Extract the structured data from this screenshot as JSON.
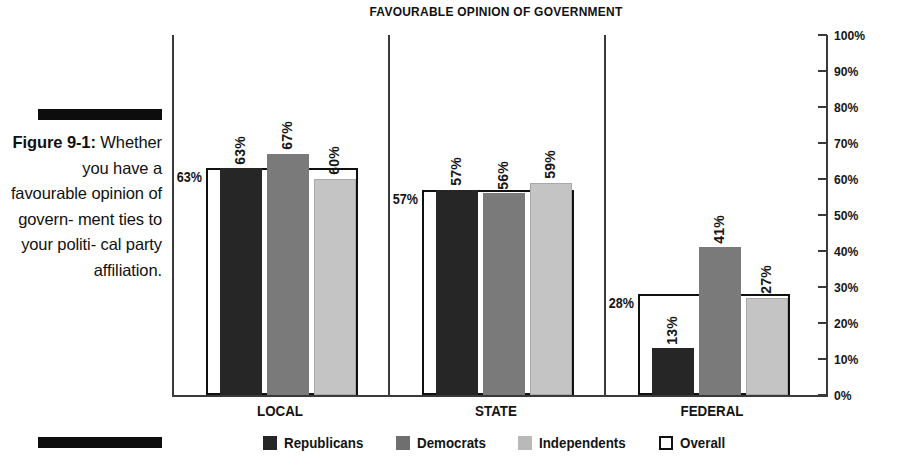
{
  "figure": {
    "number_label": "Figure 9-1:",
    "caption_text": "Whether you have a favourable opinion of govern- ment ties to your politi- cal party affiliation."
  },
  "chart_data": {
    "type": "bar",
    "title": "FAVOURABLE OPINION OF GOVERNMENT",
    "xlabel": "",
    "ylabel": "",
    "ylim": [
      0,
      100
    ],
    "grid": false,
    "legend_position": "bottom",
    "axis_side": "right",
    "value_suffix": "%",
    "categories": [
      "LOCAL",
      "STATE",
      "FEDERAL"
    ],
    "tick_labels": [
      "100%",
      "90%",
      "80%",
      "70%",
      "60%",
      "50%",
      "40%",
      "30%",
      "20%",
      "10%",
      "0%"
    ],
    "tick_values": [
      100,
      90,
      80,
      70,
      60,
      50,
      40,
      30,
      20,
      10,
      0
    ],
    "series": [
      {
        "name": "Republicans",
        "color": "#262626",
        "values": [
          63,
          57,
          13
        ],
        "labels": [
          "63%",
          "57%",
          "13%"
        ]
      },
      {
        "name": "Democrats",
        "color": "#7a7a7a",
        "values": [
          67,
          56,
          41
        ],
        "labels": [
          "67%",
          "56%",
          "41%"
        ]
      },
      {
        "name": "Independents",
        "color": "#c4c4c4",
        "values": [
          60,
          59,
          27
        ],
        "labels": [
          "60%",
          "59%",
          "27%"
        ]
      },
      {
        "name": "Overall",
        "color": "#ffffff",
        "values": [
          63,
          57,
          28
        ],
        "labels": [
          "63%",
          "57%",
          "28%"
        ]
      }
    ]
  }
}
